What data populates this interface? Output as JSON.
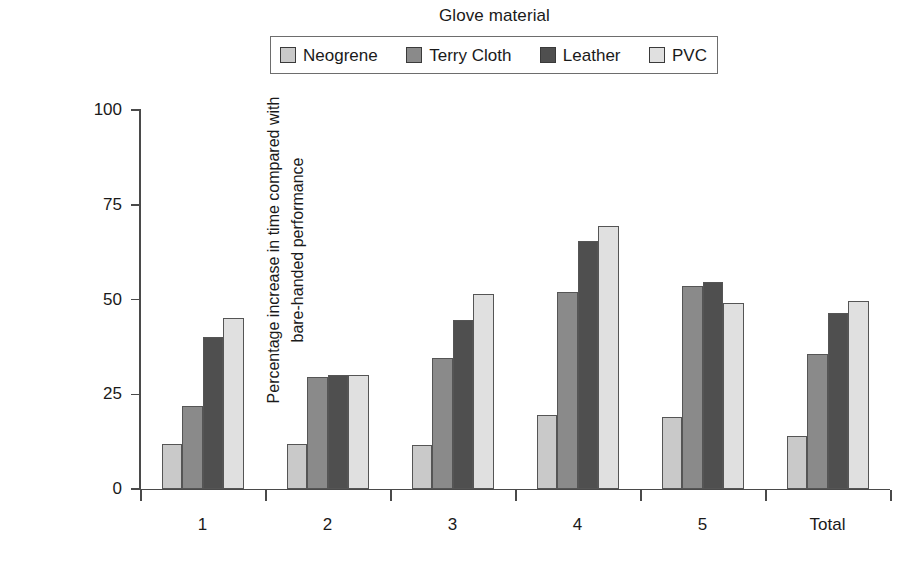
{
  "chart_data": {
    "type": "bar",
    "title": "",
    "legend_title": "Glove material",
    "legend_position": "top",
    "grid": false,
    "xlabel": "",
    "ylabel": "Percentage increase in time compared with bare-handed performance",
    "ylabel_lines": [
      "Percentage increase in time compared with",
      "bare-handed performance"
    ],
    "ylim": [
      0,
      100
    ],
    "yticks": [
      0,
      25,
      50,
      75,
      100
    ],
    "categories": [
      "1",
      "2",
      "3",
      "4",
      "5",
      "Total"
    ],
    "series": [
      {
        "name": "Neogrene",
        "color": "#c9c9c9",
        "values": [
          12,
          12,
          11.5,
          19.5,
          19,
          14
        ]
      },
      {
        "name": "Terry Cloth",
        "color": "#8a8a8a",
        "values": [
          22,
          29.5,
          34.5,
          52,
          53.5,
          35.5
        ]
      },
      {
        "name": "Leather",
        "color": "#4f4f4f",
        "values": [
          40,
          30,
          44.5,
          65.5,
          54.5,
          46.5
        ]
      },
      {
        "name": "PVC",
        "color": "#e0e0e0",
        "values": [
          45,
          30,
          51.5,
          69.5,
          49,
          49.5
        ]
      }
    ]
  }
}
